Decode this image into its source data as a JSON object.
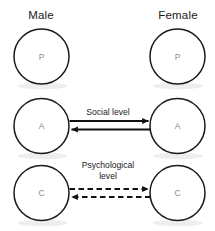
{
  "diagram": {
    "title_columns": {
      "left": "Male",
      "right": "Female"
    },
    "ego_states": {
      "parent": "P",
      "adult": "A",
      "child": "C"
    },
    "rows": [
      {
        "id": "parent",
        "left_letter": "P",
        "right_letter": "P",
        "link": null
      },
      {
        "id": "adult",
        "left_letter": "A",
        "right_letter": "A",
        "link": "Social level"
      },
      {
        "id": "child",
        "left_letter": "C",
        "right_letter": "C",
        "link": "Psychological\nlevel"
      }
    ],
    "links": {
      "social": {
        "label": "Social level",
        "style": "solid",
        "direction": "bidirectional"
      },
      "psychological": {
        "label": "Psychological\nlevel",
        "style": "dashed",
        "direction": "bidirectional"
      }
    },
    "colors": {
      "background": "#ffffff",
      "circle_stroke": "#1a1a1a",
      "circle_fill": "#ffffff",
      "arrow": "#111111",
      "label_text": "#1a1a1a",
      "letter_text": "#8a8a8a",
      "shadow": "#cfcfcf"
    }
  }
}
